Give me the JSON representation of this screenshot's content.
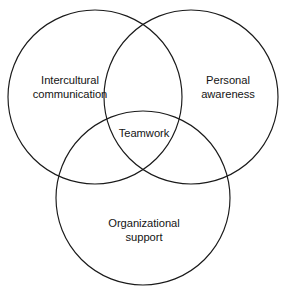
{
  "diagram": {
    "type": "venn-3-circle",
    "background_color": "#ffffff",
    "stroke_color": "#1a1a1a",
    "text_color": "#141414",
    "sets": [
      {
        "id": "intercultural-communication",
        "label": "Intercultural\ncommunication",
        "position": "top-left",
        "center_x": 95,
        "center_y": 97,
        "radius": 87
      },
      {
        "id": "personal-awareness",
        "label": "Personal\nawareness",
        "position": "top-right",
        "center_x": 191,
        "center_y": 97,
        "radius": 87
      },
      {
        "id": "organizational-support",
        "label": "Organizational\nsupport",
        "position": "bottom-center",
        "center_x": 143,
        "center_y": 198,
        "radius": 87
      }
    ],
    "intersection": {
      "id": "teamwork",
      "label": "Teamwork",
      "center_x": 144,
      "center_y": 134
    }
  }
}
